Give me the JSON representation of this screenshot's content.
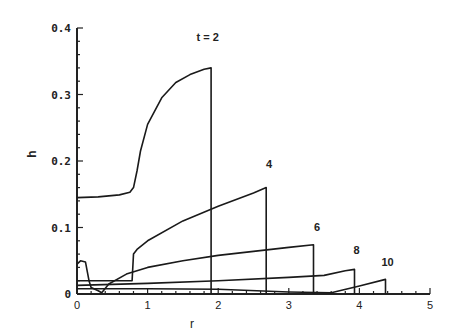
{
  "chart_data": {
    "type": "line",
    "title": "",
    "xlabel": "r",
    "ylabel": "h",
    "xlim": [
      0,
      5
    ],
    "ylim": [
      0,
      0.4
    ],
    "xticks": [
      "0",
      "1",
      "2",
      "3",
      "4",
      "5"
    ],
    "yticks": [
      "0",
      "0.1",
      "0.2",
      "0.3",
      "0.4"
    ],
    "grid": false,
    "legend": null,
    "series": [
      {
        "name": "t = 2",
        "label": "t = 2",
        "x": [
          0,
          0.3,
          0.6,
          0.75,
          0.8,
          0.85,
          0.9,
          1.0,
          1.2,
          1.4,
          1.6,
          1.8,
          1.9,
          1.9
        ],
        "y": [
          0.145,
          0.146,
          0.149,
          0.153,
          0.16,
          0.185,
          0.215,
          0.255,
          0.295,
          0.318,
          0.33,
          0.338,
          0.34,
          0
        ]
      },
      {
        "name": "t = 4",
        "label": "4",
        "x": [
          0,
          0.78,
          0.8,
          0.85,
          1.0,
          1.5,
          2.0,
          2.5,
          2.68,
          2.68
        ],
        "y": [
          0.02,
          0.02,
          0.06,
          0.067,
          0.08,
          0.11,
          0.132,
          0.152,
          0.16,
          0
        ]
      },
      {
        "name": "t = 6",
        "label": "6",
        "x": [
          0,
          0.05,
          0.12,
          0.17,
          0.2,
          0.3,
          0.35,
          0.45,
          0.7,
          1.0,
          1.5,
          2.0,
          2.5,
          3.0,
          3.35,
          3.35
        ],
        "y": [
          0.045,
          0.05,
          0.048,
          0.02,
          0.01,
          0.005,
          0.002,
          0.015,
          0.03,
          0.04,
          0.05,
          0.058,
          0.064,
          0.07,
          0.074,
          0
        ]
      },
      {
        "name": "t = 8",
        "label": "8",
        "x": [
          0,
          1.0,
          2.0,
          3.0,
          3.5,
          3.8,
          3.93,
          3.93
        ],
        "y": [
          0.013,
          0.016,
          0.02,
          0.025,
          0.028,
          0.035,
          0.037,
          0
        ]
      },
      {
        "name": "t = 10",
        "label": "10",
        "x": [
          0,
          1.0,
          2.0,
          3.0,
          3.6,
          4.0,
          4.37,
          4.37
        ],
        "y": [
          0.008,
          0.008,
          0.007,
          0.003,
          0.002,
          0.012,
          0.022,
          0
        ]
      }
    ],
    "annotations": [
      {
        "text": "t = 2",
        "x": 1.85,
        "y": 0.38
      },
      {
        "text": "4",
        "x": 2.72,
        "y": 0.19
      },
      {
        "text": "6",
        "x": 3.4,
        "y": 0.095
      },
      {
        "text": "8",
        "x": 3.96,
        "y": 0.06
      },
      {
        "text": "10",
        "x": 4.4,
        "y": 0.042
      }
    ]
  }
}
